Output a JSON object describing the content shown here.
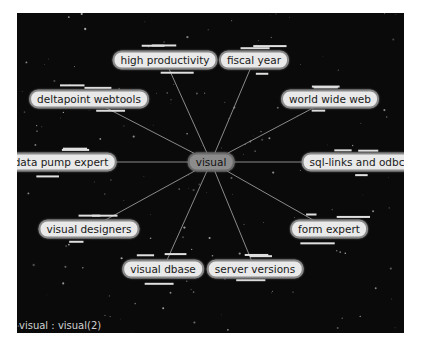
{
  "graph": {
    "center": {
      "label": "visual",
      "x": 194,
      "y": 149
    },
    "nodes": [
      {
        "label": "high productivity",
        "x": 148,
        "y": 47
      },
      {
        "label": "fiscal year",
        "x": 237,
        "y": 47
      },
      {
        "label": "deltapoint webtools",
        "x": 72,
        "y": 86
      },
      {
        "label": "world wide web",
        "x": 313,
        "y": 86
      },
      {
        "label": "data pump expert",
        "x": 44,
        "y": 149
      },
      {
        "label": "sql-links and odbc",
        "x": 340,
        "y": 149
      },
      {
        "label": "visual designers",
        "x": 72,
        "y": 216
      },
      {
        "label": "form expert",
        "x": 312,
        "y": 216
      },
      {
        "label": "visual dbase",
        "x": 146,
        "y": 256
      },
      {
        "label": "server versions",
        "x": 238,
        "y": 256
      }
    ],
    "colors": {
      "background": "#0a0a0a",
      "edge": "#8a8a8a",
      "node_fill": "#e9e9e9",
      "center_fill": "#8c8c8c"
    }
  },
  "status": {
    "text": "visual : visual(2)"
  }
}
